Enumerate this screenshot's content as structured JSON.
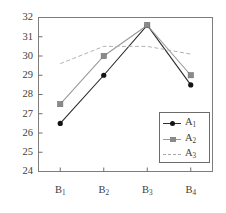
{
  "chart_data": {
    "type": "line",
    "title": "",
    "xlabel": "",
    "ylabel": "",
    "categories": [
      "B1",
      "B2",
      "B3",
      "B4"
    ],
    "category_labels": [
      {
        "base": "B",
        "sub": "1"
      },
      {
        "base": "B",
        "sub": "2"
      },
      {
        "base": "B",
        "sub": "3"
      },
      {
        "base": "B",
        "sub": "4"
      }
    ],
    "ylim": [
      24,
      32
    ],
    "yticks": [
      24,
      25,
      26,
      27,
      28,
      29,
      30,
      31,
      32
    ],
    "ytick_labels": [
      "24",
      "25",
      "26",
      "27",
      "28",
      "29",
      "30",
      "31",
      "32"
    ],
    "grid": false,
    "legend_position": "lower right",
    "series": [
      {
        "name": "A1",
        "label": {
          "base": "A",
          "sub": "1"
        },
        "values": [
          26.5,
          29.0,
          31.6,
          28.5
        ],
        "color": "#2b2b2b",
        "marker": "diamond",
        "linestyle": "solid"
      },
      {
        "name": "A2",
        "label": {
          "base": "A",
          "sub": "2"
        },
        "values": [
          27.5,
          30.0,
          31.6,
          29.0
        ],
        "color": "#9a9a9a",
        "marker": "square",
        "linestyle": "solid"
      },
      {
        "name": "A3",
        "label": {
          "base": "A",
          "sub": "3"
        },
        "values": [
          29.6,
          30.5,
          30.5,
          30.1
        ],
        "color": "#b2b2b2",
        "marker": "none",
        "linestyle": "dashed"
      }
    ]
  },
  "axes": {
    "frame_color": "#7d7d7d",
    "tick_color": "#6e6e6e"
  }
}
